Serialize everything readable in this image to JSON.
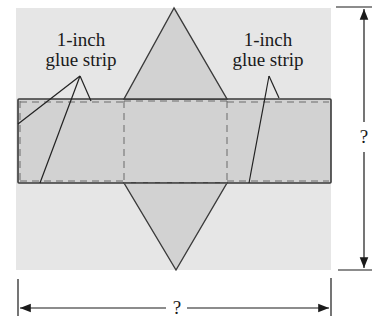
{
  "diagram": {
    "labels": {
      "left_glue_strip": {
        "line1": "1-inch",
        "line2": "glue strip"
      },
      "right_glue_strip": {
        "line1": "1-inch",
        "line2": "glue strip"
      }
    },
    "dimensions": {
      "height_label": "?",
      "width_label": "?"
    },
    "colors": {
      "sheet": "#e6e6e6",
      "shape_fill": "#d2d2d2",
      "outline": "#3a3a3a",
      "dashed": "#6a6a6a",
      "text": "#1a1a1a"
    }
  }
}
